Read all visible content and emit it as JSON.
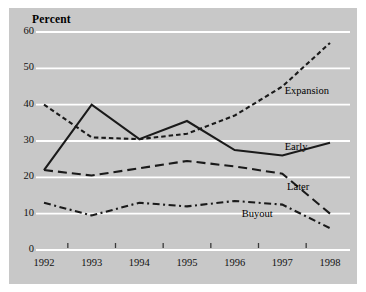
{
  "figure": {
    "background_color": "#ffffff",
    "panel_color": "#c8c8c8",
    "gridline_color": "#ffffff",
    "line_color": "#1a1a1a"
  },
  "chart_data": {
    "type": "line",
    "title": "",
    "subtitle": "",
    "ylabel": "Percent",
    "xlabel": "",
    "x": [
      1992,
      1993,
      1994,
      1995,
      1996,
      1997,
      1998
    ],
    "categories": [
      "1992",
      "1993",
      "1994",
      "1995",
      "1996",
      "1997",
      "1998"
    ],
    "xlim": [
      1992,
      1998
    ],
    "ylim": [
      0,
      60
    ],
    "yticks": [
      0,
      10,
      20,
      30,
      40,
      50,
      60
    ],
    "ytick_labels": [
      "0",
      "10",
      "20",
      "30",
      "40",
      "50",
      "60"
    ],
    "xtick_labels": [
      "1992",
      "1993",
      "1994",
      "1995",
      "1996",
      "1997",
      "1998"
    ],
    "grid": true,
    "grid_axis": "y",
    "legend_position": "inline-annotations",
    "series": [
      {
        "name": "Expansion",
        "style": "dotted",
        "values": [
          40,
          31,
          30.5,
          32,
          37,
          45,
          57
        ]
      },
      {
        "name": "Early",
        "style": "solid",
        "values": [
          22,
          40,
          30.5,
          35.5,
          27.5,
          26,
          29.5
        ]
      },
      {
        "name": "Later",
        "style": "dashed",
        "values": [
          22,
          20.5,
          22.5,
          24.5,
          23,
          21,
          10
        ]
      },
      {
        "name": "Buyout",
        "style": "dash-dot",
        "values": [
          13,
          9.5,
          13,
          12,
          13.5,
          12.5,
          6
        ]
      }
    ],
    "annotations": [
      {
        "text": "Expansion",
        "x": 1997.05,
        "y": 43.5
      },
      {
        "text": "Early",
        "x": 1997.05,
        "y": 28.0
      },
      {
        "text": "Later",
        "x": 1997.1,
        "y": 17.0
      },
      {
        "text": "Buyout",
        "x": 1996.15,
        "y": 9.5
      }
    ]
  }
}
